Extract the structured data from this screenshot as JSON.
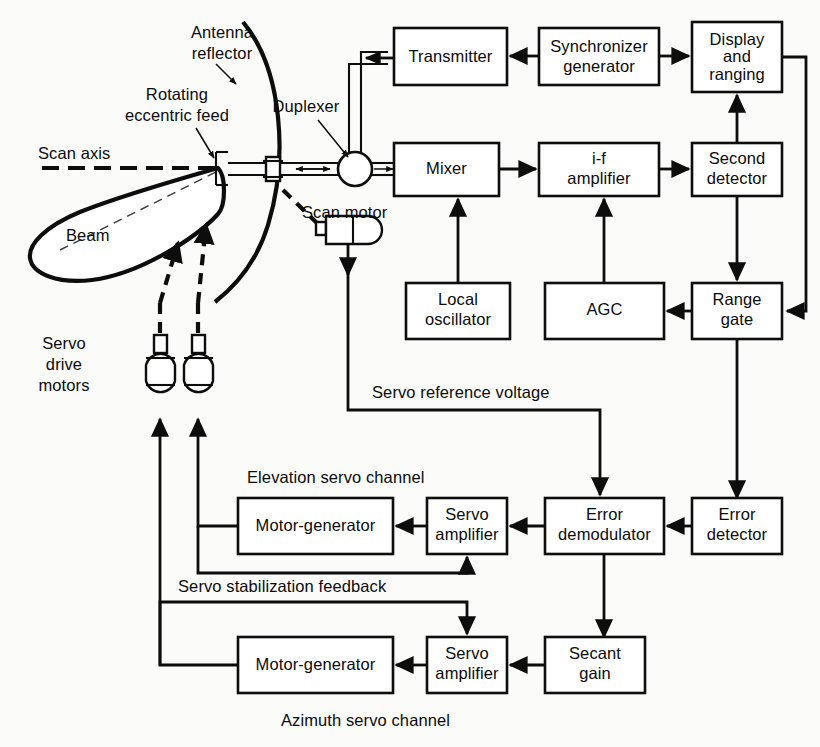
{
  "figure": {
    "kind": "conical-scan tracking radar block diagram",
    "background_color": "#fbfbfa",
    "ink_color": "#0d0d0d"
  },
  "blocks": {
    "transmitter": "Transmitter",
    "synchronizer_generator_line1": "Synchronizer",
    "synchronizer_generator_line2": "generator",
    "display_and_ranging_line1": "Display",
    "display_and_ranging_line2": "and",
    "display_and_ranging_line3": "ranging",
    "mixer": "Mixer",
    "if_amplifier_line1": "i-f",
    "if_amplifier_line2": "amplifier",
    "second_detector_line1": "Second",
    "second_detector_line2": "detector",
    "local_oscillator_line1": "Local",
    "local_oscillator_line2": "oscillator",
    "agc": "AGC",
    "range_gate_line1": "Range",
    "range_gate_line2": "gate",
    "error_detector_line1": "Error",
    "error_detector_line2": "detector",
    "error_demodulator_line1": "Error",
    "error_demodulator_line2": "demodulator",
    "servo_amplifier_elev_line1": "Servo",
    "servo_amplifier_elev_line2": "amplifier",
    "motor_generator_elev": "Motor-generator",
    "secant_gain_line1": "Secant",
    "secant_gain_line2": "gain",
    "servo_amplifier_az_line1": "Servo",
    "servo_amplifier_az_line2": "amplifier",
    "motor_generator_az": "Motor-generator"
  },
  "annotations": {
    "antenna_reflector_line1": "Antenna",
    "antenna_reflector_line2": "reflector",
    "rotating_eccentric_feed_line1": "Rotating",
    "rotating_eccentric_feed_line2": "eccentric feed",
    "scan_axis": "Scan axis",
    "beam": "Beam",
    "duplexer": "Duplexer",
    "scan_motor": "Scan motor",
    "servo_drive_motors_line1": "Servo",
    "servo_drive_motors_line2": "drive",
    "servo_drive_motors_line3": "motors",
    "servo_reference_voltage": "Servo reference voltage",
    "elevation_servo_channel": "Elevation servo channel",
    "servo_stabilization_feedback": "Servo stabilization feedback",
    "azimuth_servo_channel": "Azimuth servo channel"
  },
  "icons": {
    "duplexer": "duplexer-circle-icon",
    "scan_motor": "motor-capsule-icon",
    "servo_motor_left": "motor-capsule-icon",
    "servo_motor_right": "motor-capsule-icon",
    "reflector": "parabolic-reflector-icon",
    "beam_lobe": "antenna-beam-lobe-icon"
  }
}
